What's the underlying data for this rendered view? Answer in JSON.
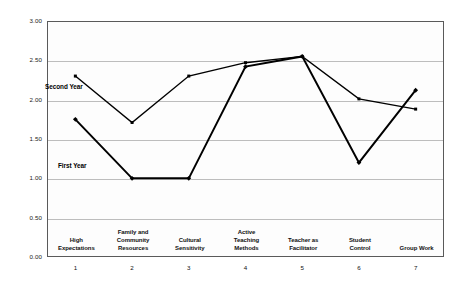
{
  "chart_data": {
    "type": "line",
    "title": "",
    "subtitle": "",
    "xlabel": "",
    "ylabel": "",
    "ylim": [
      0.0,
      3.0
    ],
    "ytick_step": 0.5,
    "grid": true,
    "legend_position": "inline-annotation",
    "categories": [
      "High Expectations",
      "Family and Community Resources",
      "Cultural Sensitivity",
      "Active Teaching Methods",
      "Teacher as Facilitator",
      "Student Control",
      "Group Work"
    ],
    "category_lines": [
      [
        "High",
        "Expectations"
      ],
      [
        "Family and",
        "Community",
        "Resources"
      ],
      [
        "Cultural",
        "Sensitivity"
      ],
      [
        "Active",
        "Teaching",
        "Methods"
      ],
      [
        "Teacher as",
        "Facilitator"
      ],
      [
        "Student",
        "Control"
      ],
      [
        "Group Work"
      ]
    ],
    "x": [
      1,
      2,
      3,
      4,
      5,
      6,
      7
    ],
    "xtick_labels": [
      "1",
      "2",
      "3",
      "4",
      "5",
      "6",
      "7"
    ],
    "ytick_labels": [
      "0.00",
      "0.50",
      "1.00",
      "1.50",
      "2.00",
      "2.50",
      "3.00"
    ],
    "ytick_values": [
      0.0,
      0.5,
      1.0,
      1.5,
      2.0,
      2.5,
      3.0
    ],
    "series": [
      {
        "name": "First Year",
        "color": "#000000",
        "marker": "diamond",
        "values": [
          1.75,
          1.0,
          1.0,
          2.42,
          2.55,
          1.2,
          2.12
        ]
      },
      {
        "name": "Second Year",
        "color": "#000000",
        "marker": "square",
        "values": [
          2.3,
          1.71,
          2.3,
          2.47,
          2.55,
          2.01,
          1.88
        ]
      }
    ],
    "annotations": [
      {
        "text": "Second Year",
        "series": "Second Year"
      },
      {
        "text": "First Year",
        "series": "First Year"
      }
    ],
    "colors": {
      "line": "#000000",
      "grid": "#bdbdbd",
      "frame": "#5a5a5a",
      "plot_background": "#fdfdfd",
      "page_background": "#ffffff",
      "text": "#111111"
    }
  }
}
